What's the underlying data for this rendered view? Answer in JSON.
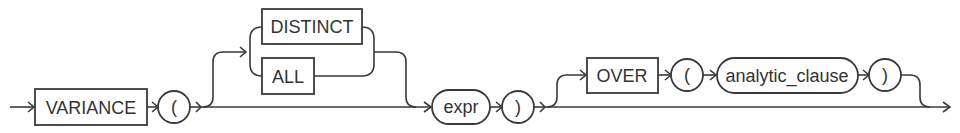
{
  "diagram": {
    "type": "railroad-syntax-diagram",
    "function_keyword": "VARIANCE",
    "open_paren": "(",
    "close_paren": ")",
    "options": {
      "distinct": "DISTINCT",
      "all": "ALL"
    },
    "argument": "expr",
    "over_clause": {
      "keyword": "OVER",
      "open_paren": "(",
      "clause": "analytic_clause",
      "close_paren": ")"
    }
  },
  "colors": {
    "line": "#3a3a3a",
    "text": "#333333",
    "background": "#ffffff"
  }
}
